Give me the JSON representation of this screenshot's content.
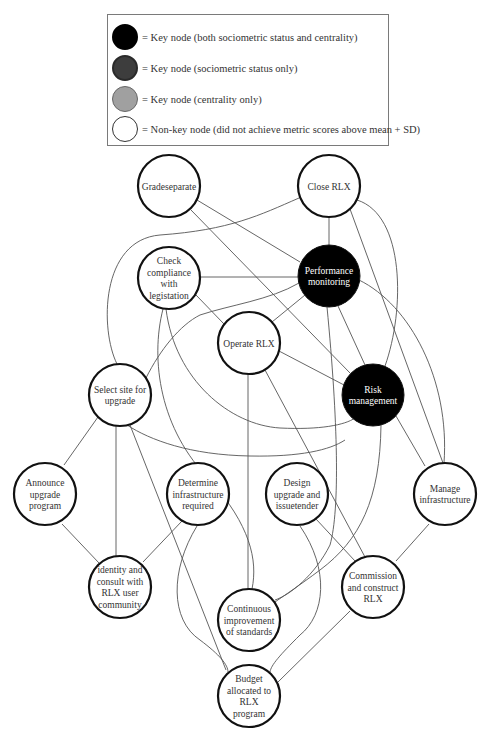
{
  "legend": {
    "items": [
      {
        "fill": "#000000",
        "stroke": "#000000",
        "label": "= Key node (both sociometric status and centrality)"
      },
      {
        "fill": "#3d3d3d",
        "stroke": "#2a2a2a",
        "label": "= Key node (sociometric status only)"
      },
      {
        "fill": "#a0a0a0",
        "stroke": "#666666",
        "label": "= Key node (centrality only)"
      },
      {
        "fill": "#ffffff",
        "stroke": "#333333",
        "label": "= Non-key node (did not achieve metric scores above mean + SD)"
      }
    ]
  },
  "nodes": [
    {
      "id": "gradeseparate",
      "lines": [
        "Gradeseparate"
      ],
      "x": 169,
      "y": 186,
      "type": "non-key"
    },
    {
      "id": "close-rlx",
      "lines": [
        "Close RLX"
      ],
      "x": 329,
      "y": 186,
      "type": "non-key"
    },
    {
      "id": "check-compliance",
      "lines": [
        "Check",
        "compliance",
        "with",
        "legistation"
      ],
      "x": 169,
      "y": 278,
      "type": "non-key"
    },
    {
      "id": "performance-monitoring",
      "lines": [
        "Performance",
        "monitoring"
      ],
      "x": 329,
      "y": 276,
      "type": "key-both"
    },
    {
      "id": "operate-rlx",
      "lines": [
        "Operate RLX"
      ],
      "x": 249,
      "y": 343,
      "type": "non-key"
    },
    {
      "id": "select-site",
      "lines": [
        "Select site for",
        "upgrade"
      ],
      "x": 120,
      "y": 395,
      "type": "non-key"
    },
    {
      "id": "risk-management",
      "lines": [
        "Risk",
        "management"
      ],
      "x": 373,
      "y": 395,
      "type": "key-both"
    },
    {
      "id": "announce-upgrade",
      "lines": [
        "Announce",
        "upgrade",
        "program"
      ],
      "x": 45,
      "y": 494,
      "type": "non-key"
    },
    {
      "id": "determine-infrastructure",
      "lines": [
        "Determine",
        "infrastructure",
        "required"
      ],
      "x": 198,
      "y": 494,
      "type": "non-key"
    },
    {
      "id": "design-upgrade",
      "lines": [
        "Design",
        "upgrade and",
        "issuetender"
      ],
      "x": 297,
      "y": 494,
      "type": "non-key"
    },
    {
      "id": "manage-infrastructure",
      "lines": [
        "Manage",
        "infrastructure"
      ],
      "x": 445,
      "y": 494,
      "type": "non-key"
    },
    {
      "id": "identity-consult",
      "lines": [
        "identity and",
        "consult with",
        "RLX user",
        "community"
      ],
      "x": 120,
      "y": 587,
      "type": "non-key"
    },
    {
      "id": "continuous-improvement",
      "lines": [
        "Continuous",
        "improvement",
        "of standards"
      ],
      "x": 249,
      "y": 620,
      "type": "non-key"
    },
    {
      "id": "commission-construct",
      "lines": [
        "Commission",
        "and construct",
        "RLX"
      ],
      "x": 373,
      "y": 587,
      "type": "non-key"
    },
    {
      "id": "budget-allocated",
      "lines": [
        "Budget",
        "allocated to",
        "RLX",
        "program"
      ],
      "x": 249,
      "y": 696,
      "type": "non-key"
    }
  ],
  "edges": [
    {
      "from": "gradeseparate",
      "to": "performance-monitoring"
    },
    {
      "from": "gradeseparate",
      "to": "risk-management"
    },
    {
      "from": "close-rlx",
      "to": "performance-monitoring"
    },
    {
      "from": "close-rlx",
      "to": "select-site"
    },
    {
      "from": "close-rlx",
      "to": "risk-management"
    },
    {
      "from": "close-rlx",
      "to": "manage-infrastructure"
    },
    {
      "from": "check-compliance",
      "to": "performance-monitoring"
    },
    {
      "from": "check-compliance",
      "to": "operate-rlx"
    },
    {
      "from": "check-compliance",
      "to": "risk-management"
    },
    {
      "from": "check-compliance",
      "to": "continuous-improvement"
    },
    {
      "from": "performance-monitoring",
      "to": "operate-rlx"
    },
    {
      "from": "performance-monitoring",
      "to": "select-site"
    },
    {
      "from": "performance-monitoring",
      "to": "risk-management"
    },
    {
      "from": "performance-monitoring",
      "to": "manage-infrastructure"
    },
    {
      "from": "performance-monitoring",
      "to": "continuous-improvement"
    },
    {
      "from": "operate-rlx",
      "to": "risk-management"
    },
    {
      "from": "operate-rlx",
      "to": "continuous-improvement"
    },
    {
      "from": "operate-rlx",
      "to": "commission-construct"
    },
    {
      "from": "select-site",
      "to": "announce-upgrade"
    },
    {
      "from": "select-site",
      "to": "identity-consult"
    },
    {
      "from": "select-site",
      "to": "budget-allocated"
    },
    {
      "from": "select-site",
      "to": "risk-management"
    },
    {
      "from": "risk-management",
      "to": "manage-infrastructure"
    },
    {
      "from": "risk-management",
      "to": "continuous-improvement"
    },
    {
      "from": "announce-upgrade",
      "to": "identity-consult"
    },
    {
      "from": "determine-infrastructure",
      "to": "identity-consult"
    },
    {
      "from": "determine-infrastructure",
      "to": "budget-allocated"
    },
    {
      "from": "design-upgrade",
      "to": "commission-construct"
    },
    {
      "from": "design-upgrade",
      "to": "budget-allocated"
    },
    {
      "from": "manage-infrastructure",
      "to": "commission-construct"
    },
    {
      "from": "commission-construct",
      "to": "budget-allocated"
    }
  ]
}
